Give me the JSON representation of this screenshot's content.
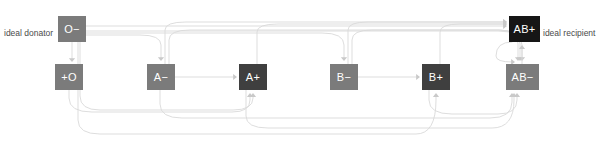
{
  "diagram": {
    "colors": {
      "node_light": "#7b7b7b",
      "node_mid": "#3f3f3f",
      "node_dark": "#161616",
      "edge": "#d9d9d9",
      "edge_strong": "#c9c9c9",
      "label_text": "#4a4a4a",
      "node_text": "#ffffff",
      "background": "#ffffff"
    },
    "annotations": [
      {
        "id": "ideal-donator",
        "text": "ideal donator",
        "x": 4,
        "y": 29,
        "align": "left"
      },
      {
        "id": "ideal-recipient",
        "text": "ideal recipient",
        "x": 543,
        "y": 29,
        "align": "left"
      }
    ],
    "nodes": [
      {
        "id": "o-neg",
        "label": "O−",
        "x": 58,
        "y": 16,
        "w": 28,
        "h": 26,
        "shade": "node_light"
      },
      {
        "id": "ab-pos",
        "label": "AB+",
        "x": 509,
        "y": 16,
        "w": 31,
        "h": 26,
        "shade": "node_dark"
      },
      {
        "id": "o-pos",
        "label": "+O",
        "x": 55,
        "y": 64,
        "w": 28,
        "h": 26,
        "shade": "node_light"
      },
      {
        "id": "a-neg",
        "label": "A−",
        "x": 147,
        "y": 64,
        "w": 28,
        "h": 26,
        "shade": "node_light"
      },
      {
        "id": "a-pos",
        "label": "A+",
        "x": 239,
        "y": 64,
        "w": 28,
        "h": 26,
        "shade": "node_mid"
      },
      {
        "id": "b-neg",
        "label": "B−",
        "x": 330,
        "y": 64,
        "w": 28,
        "h": 26,
        "shade": "node_light"
      },
      {
        "id": "b-pos",
        "label": "B+",
        "x": 422,
        "y": 64,
        "w": 28,
        "h": 26,
        "shade": "node_mid"
      },
      {
        "id": "ab-neg",
        "label": "AB−",
        "x": 506,
        "y": 64,
        "w": 33,
        "h": 26,
        "shade": "node_light"
      }
    ],
    "edges": [
      {
        "id": "o-neg-to-o-pos",
        "from": "o-neg",
        "to": "o-pos",
        "d": "M 72,42 L 72,60",
        "arrow": [
          72,
          62,
          "down"
        ]
      },
      {
        "id": "o-neg-to-ab-pos",
        "from": "o-neg",
        "to": "ab-pos",
        "d": "M 86,26 L 503,26",
        "arrow": [
          507,
          26,
          "right"
        ]
      },
      {
        "id": "o-neg-to-a-neg",
        "from": "o-neg",
        "to": "a-neg",
        "d": "M 86,35 L 140,35 Q 161,35 161,45 L 161,58",
        "arrow": [
          161,
          61,
          "down"
        ]
      },
      {
        "id": "o-neg-to-b-neg",
        "from": "o-neg",
        "to": "b-neg",
        "d": "M 86,33 L 322,33 Q 344,33 344,45 L 344,58",
        "arrow": [
          344,
          61,
          "down"
        ]
      },
      {
        "id": "o-neg-to-ab-neg",
        "from": "o-neg",
        "to": "ab-neg",
        "d": "M 86,31 L 498,31 Q 522,31 522,45 L 522,58",
        "arrow": [
          522,
          61,
          "down"
        ]
      },
      {
        "id": "o-neg-to-a-pos",
        "from": "o-neg",
        "to": "a-pos",
        "d": "M 80,42 L 80,96 Q 80,110 100,110 L 233,110 Q 253,110 253,98 L 253,96",
        "arrow": [
          253,
          93,
          "up"
        ]
      },
      {
        "id": "o-neg-to-b-pos",
        "from": "o-neg",
        "to": "b-pos",
        "d": "M 78,42 L 78,120 Q 78,134 100,134 L 416,134 Q 436,134 436,100 L 436,96",
        "arrow": [
          436,
          93,
          "up"
        ]
      },
      {
        "id": "a-neg-to-a-pos",
        "from": "a-neg",
        "to": "a-pos",
        "d": "M 175,77 L 233,77",
        "arrow": [
          237,
          77,
          "right"
        ]
      },
      {
        "id": "a-neg-to-ab-neg",
        "from": "a-neg",
        "to": "ab-neg",
        "d": "M 169,64 L 169,40 Q 169,30 190,30 L 498,30 Q 520,30 520,44 L 520,58",
        "arrow": [
          520,
          61,
          "down"
        ]
      },
      {
        "id": "a-neg-to-ab-pos",
        "from": "a-neg",
        "to": "ab-pos",
        "d": "M 165,64 L 165,30 Q 165,22 186,22 L 503,22",
        "arrow": [
          507,
          22,
          "right"
        ]
      },
      {
        "id": "a-pos-to-ab-pos",
        "from": "a-pos",
        "to": "ab-pos",
        "d": "M 257,64 L 257,32 Q 257,24 278,24 L 503,24",
        "arrow": [
          507,
          24,
          "right"
        ]
      },
      {
        "id": "b-neg-to-b-pos",
        "from": "b-neg",
        "to": "b-pos",
        "d": "M 358,77 L 416,77",
        "arrow": [
          420,
          77,
          "right"
        ]
      },
      {
        "id": "b-neg-to-ab-neg",
        "from": "b-neg",
        "to": "ab-neg",
        "d": "M 352,64 L 352,40 Q 352,30 372,30 L 500,30 Q 518,30 518,44 L 518,58",
        "arrow": [
          518,
          61,
          "down"
        ]
      },
      {
        "id": "b-neg-to-ab-pos",
        "from": "b-neg",
        "to": "ab-pos",
        "d": "M 348,64 L 348,30 Q 348,22 368,22 L 503,22",
        "arrow": [
          507,
          22,
          "right"
        ]
      },
      {
        "id": "b-pos-to-ab-pos",
        "from": "b-pos",
        "to": "ab-pos",
        "d": "M 440,64 L 440,32 Q 440,24 460,24 L 503,24",
        "arrow": [
          507,
          24,
          "right"
        ]
      },
      {
        "id": "ab-neg-to-ab-pos",
        "from": "ab-neg",
        "to": "ab-pos",
        "d": "M 522,64 L 522,48",
        "arrow": [
          522,
          45,
          "up"
        ]
      },
      {
        "id": "ab-pos-to-ab-neg",
        "from": "ab-pos",
        "to": "ab-neg",
        "d": "M 512,42 Q 496,42 496,56 Q 496,62 512,62",
        "arrow": [
          515,
          62,
          "right"
        ]
      },
      {
        "id": "o-pos-to-a-pos",
        "from": "o-pos",
        "to": "a-pos",
        "d": "M 69,90 L 69,98 Q 69,112 92,112 L 232,112 Q 250,112 250,100 L 250,96",
        "arrow": [
          250,
          93,
          "up"
        ]
      },
      {
        "id": "a-pos-to-ab-neg",
        "from": "a-pos",
        "to": "ab-neg",
        "d": "M 246,90 L 246,116 Q 246,128 268,128 L 492,128 Q 514,128 514,100 L 514,96",
        "arrow": [
          514,
          93,
          "up"
        ]
      },
      {
        "id": "b-pos-to-ab-neg",
        "from": "b-pos",
        "to": "ab-neg",
        "d": "M 429,90 L 429,100 Q 429,114 452,114 L 498,114 Q 517,114 517,100 L 517,96",
        "arrow": [
          517,
          93,
          "up"
        ]
      },
      {
        "id": "a-neg-bottom",
        "from": "a-neg",
        "to": "ab-neg",
        "d": "M 160,90 L 160,104 Q 160,118 182,118 L 490,118 Q 512,118 512,102 L 512,96",
        "arrow": [
          512,
          93,
          "up"
        ]
      }
    ]
  }
}
